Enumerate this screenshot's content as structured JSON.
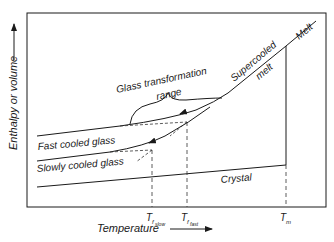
{
  "diagram": {
    "axes": {
      "y_label": "Enthalpy or volume",
      "x_label": "Temperature"
    },
    "curves": {
      "melt": "Melt",
      "supercooled_1": "Supercooled",
      "supercooled_2": "melt",
      "glass_range_1": "Glass transformation",
      "glass_range_2": "range",
      "fast_glass": "Fast cooled glass",
      "slow_glass": "Slowly cooled glass",
      "crystal": "Crystal"
    },
    "ticks": {
      "tf_slow_main": "T",
      "tf_slow_sub": "f",
      "tf_slow_subsub": "slow",
      "tf_fast_main": "T",
      "tf_fast_sub": "f",
      "tf_fast_subsub": "fast",
      "tm_main": "T",
      "tm_sub": "m"
    },
    "colors": {
      "line": "#1a1a1a",
      "dashed": "#333333"
    }
  }
}
